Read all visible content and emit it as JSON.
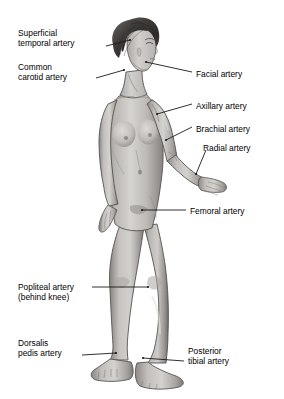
{
  "diagram": {
    "style": "grayscale medical illustration",
    "colors": {
      "background": "#ffffff",
      "skin_light": "#d8d6d3",
      "skin_mid": "#b4b1ae",
      "skin_shadow": "#8e8b88",
      "skin_deep": "#6e6b68",
      "hair_dark": "#4a4745",
      "hair_darkest": "#2e2c2b",
      "outline": "#4f4d4b",
      "leader_line": "#1a1a1a",
      "text": "#000000"
    },
    "labels": [
      {
        "id": "superficial-temporal-artery",
        "side": "left",
        "lines": [
          "Superficial",
          "temporal artery"
        ],
        "text_x": 18,
        "text_y": 28,
        "leader": {
          "x1": 106,
          "y1": 46,
          "x2": 130,
          "y2": 40
        }
      },
      {
        "id": "common-carotid-artery",
        "side": "left",
        "lines": [
          "Common",
          "carotid artery"
        ],
        "text_x": 18,
        "text_y": 62,
        "leader": {
          "x1": 96,
          "y1": 78,
          "x2": 124,
          "y2": 70
        }
      },
      {
        "id": "facial-artery",
        "side": "right",
        "lines": [
          "Facial artery"
        ],
        "text_x": 196,
        "text_y": 69,
        "leader": {
          "x1": 192,
          "y1": 72,
          "x2": 146,
          "y2": 62
        }
      },
      {
        "id": "axillary-artery",
        "side": "right",
        "lines": [
          "Axillary artery"
        ],
        "text_x": 196,
        "text_y": 101,
        "leader": {
          "x1": 192,
          "y1": 104,
          "x2": 157,
          "y2": 114
        }
      },
      {
        "id": "brachial-artery",
        "side": "right",
        "lines": [
          "Brachial artery"
        ],
        "text_x": 196,
        "text_y": 124,
        "leader": {
          "x1": 192,
          "y1": 127,
          "x2": 166,
          "y2": 140
        }
      },
      {
        "id": "radial-artery",
        "side": "right",
        "lines": [
          "Radial artery"
        ],
        "text_x": 203,
        "text_y": 143,
        "leader": {
          "x1": 206,
          "y1": 150,
          "x2": 196,
          "y2": 174
        }
      },
      {
        "id": "femoral-artery",
        "side": "right",
        "lines": [
          "Femoral artery"
        ],
        "text_x": 190,
        "text_y": 206,
        "leader": {
          "x1": 186,
          "y1": 210,
          "x2": 142,
          "y2": 210
        }
      },
      {
        "id": "popliteal-artery",
        "side": "left",
        "lines": [
          "Popliteal artery",
          "(behind knee)"
        ],
        "text_x": 18,
        "text_y": 282,
        "leader": {
          "x1": 92,
          "y1": 287,
          "x2": 148,
          "y2": 287
        }
      },
      {
        "id": "dorsalis-pedis-artery",
        "side": "left",
        "lines": [
          "Dorsalis",
          "pedis artery"
        ],
        "text_x": 18,
        "text_y": 338,
        "leader": {
          "x1": 82,
          "y1": 355,
          "x2": 116,
          "y2": 353
        }
      },
      {
        "id": "posterior-tibial-artery",
        "side": "right",
        "lines": [
          "Posterior",
          "tibial artery"
        ],
        "text_x": 188,
        "text_y": 346,
        "leader": {
          "x1": 184,
          "y1": 361,
          "x2": 143,
          "y2": 358
        }
      }
    ]
  }
}
